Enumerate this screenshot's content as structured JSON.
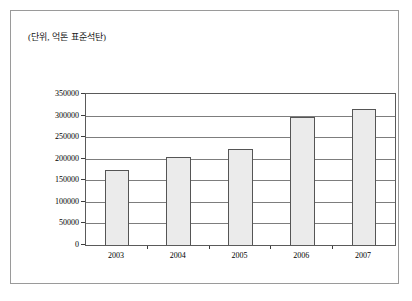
{
  "figure": {
    "caption": "(단위, 억톤 표준석탄)"
  },
  "chart_data": {
    "type": "bar",
    "title": "",
    "subtitle": "",
    "caption": "(단위, 억톤 표준석탄)",
    "xlabel": "",
    "ylabel": "",
    "categories": [
      "2003",
      "2004",
      "2005",
      "2006",
      "2007"
    ],
    "values": [
      175000,
      205000,
      222000,
      297000,
      315000
    ],
    "series": [
      {
        "name": "",
        "values": [
          175000,
          205000,
          222000,
          297000,
          315000
        ]
      }
    ],
    "ylim": [
      0,
      350000
    ],
    "yticks": [
      0,
      50000,
      100000,
      150000,
      200000,
      250000,
      300000,
      350000
    ],
    "ytick_labels": [
      "0",
      "50000",
      "100000",
      "150000",
      "200000",
      "250000",
      "300000",
      "350000"
    ],
    "xtick_labels": [
      "2003",
      "2004",
      "2005",
      "2006",
      "2007"
    ],
    "grid": true,
    "grid_axis": "y",
    "legend": false,
    "legend_position": "none",
    "bar_fill_color": "#ebebeb",
    "bar_border_color": "#555555",
    "gridline_color": "#7d7d7d",
    "axis_color": "#5a5a5a",
    "background_color": "#ffffff"
  }
}
